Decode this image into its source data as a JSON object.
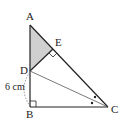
{
  "diagram": {
    "type": "geometry",
    "points": {
      "A": {
        "label": "A",
        "x": 30,
        "y": 25
      },
      "E": {
        "label": "E",
        "x": 53,
        "y": 49
      },
      "D": {
        "label": "D",
        "x": 30,
        "y": 71
      },
      "B": {
        "label": "B",
        "x": 30,
        "y": 107
      },
      "C": {
        "label": "C",
        "x": 108,
        "y": 107
      }
    },
    "measurement": {
      "segment": "DB",
      "label": "6 cm"
    },
    "shaded_region": "triangle ADE",
    "right_angles": [
      "B",
      "E"
    ],
    "equal_angle_marks": [
      "angle DCE",
      "angle DCB"
    ],
    "colors": {
      "line": "#222222",
      "shade": "#d0d0d0",
      "thin_line": "#555555"
    }
  }
}
